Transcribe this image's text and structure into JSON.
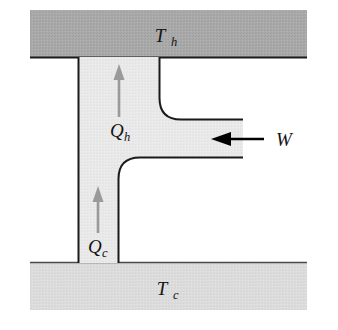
{
  "figure": {
    "name": "heat-pump-schematic"
  },
  "reservoirs": {
    "hot": {
      "label_main": "T",
      "label_sub": "h",
      "fill_color": "#a9a9a9",
      "edge_color": "#1a1a1a"
    },
    "cold": {
      "label_main": "T",
      "label_sub": "c",
      "fill_color": "#dcdcdc",
      "edge_color": "#1a1a1a"
    }
  },
  "flows": {
    "heat_out": {
      "label_main": "Q",
      "label_sub": "h",
      "arrow_color": "#9a9a9a",
      "direction": "up"
    },
    "heat_in": {
      "label_main": "Q",
      "label_sub": "c",
      "arrow_color": "#9a9a9a",
      "direction": "up"
    },
    "work_in": {
      "label_main": "W",
      "label_sub": "",
      "arrow_color": "#000000",
      "direction": "left"
    }
  },
  "device": {
    "body_fill": "#e9e9e9",
    "outline_color": "#1a1a1a"
  },
  "canvas": {
    "background": "#ffffff",
    "width": "338",
    "height": "330"
  }
}
